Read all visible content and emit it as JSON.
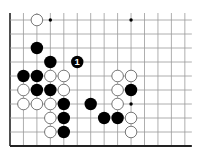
{
  "board": {
    "columns": 14,
    "rows": 10,
    "origin_x": 10,
    "origin_y": 20,
    "spacing_x": 13.45,
    "spacing_y": 14.0,
    "top_extension": 7,
    "right_extension": 7,
    "line_color": "#9a9a9a",
    "edge_color": "#222222",
    "edges": {
      "left": true,
      "bottom": true,
      "top": false,
      "right": false
    }
  },
  "star_points": [
    {
      "col": 3,
      "row": 0
    },
    {
      "col": 9,
      "row": 0
    },
    {
      "col": 9,
      "row": 6
    }
  ],
  "stones": [
    {
      "col": 2,
      "row": 0,
      "color": "white"
    },
    {
      "col": 2,
      "row": 2,
      "color": "black"
    },
    {
      "col": 3,
      "row": 3,
      "color": "black"
    },
    {
      "col": 5,
      "row": 3,
      "color": "black",
      "label": "1"
    },
    {
      "col": 1,
      "row": 4,
      "color": "black"
    },
    {
      "col": 2,
      "row": 4,
      "color": "black"
    },
    {
      "col": 3,
      "row": 4,
      "color": "white"
    },
    {
      "col": 4,
      "row": 4,
      "color": "white"
    },
    {
      "col": 8,
      "row": 4,
      "color": "white"
    },
    {
      "col": 9,
      "row": 4,
      "color": "white"
    },
    {
      "col": 1,
      "row": 5,
      "color": "white"
    },
    {
      "col": 2,
      "row": 5,
      "color": "black"
    },
    {
      "col": 3,
      "row": 5,
      "color": "black"
    },
    {
      "col": 4,
      "row": 5,
      "color": "white"
    },
    {
      "col": 8,
      "row": 5,
      "color": "white"
    },
    {
      "col": 9,
      "row": 5,
      "color": "black"
    },
    {
      "col": 1,
      "row": 6,
      "color": "white"
    },
    {
      "col": 2,
      "row": 6,
      "color": "white"
    },
    {
      "col": 3,
      "row": 6,
      "color": "white"
    },
    {
      "col": 4,
      "row": 6,
      "color": "black"
    },
    {
      "col": 6,
      "row": 6,
      "color": "black"
    },
    {
      "col": 8,
      "row": 6,
      "color": "white"
    },
    {
      "col": 3,
      "row": 7,
      "color": "white"
    },
    {
      "col": 4,
      "row": 7,
      "color": "black"
    },
    {
      "col": 7,
      "row": 7,
      "color": "black"
    },
    {
      "col": 8,
      "row": 7,
      "color": "black"
    },
    {
      "col": 9,
      "row": 7,
      "color": "white"
    },
    {
      "col": 3,
      "row": 8,
      "color": "white"
    },
    {
      "col": 4,
      "row": 8,
      "color": "black"
    },
    {
      "col": 9,
      "row": 8,
      "color": "white"
    }
  ],
  "colors": {
    "black_stone": "#000000",
    "white_stone_fill": "#ffffff",
    "white_stone_stroke": "#555555",
    "label_on_black": "#ffffff"
  }
}
